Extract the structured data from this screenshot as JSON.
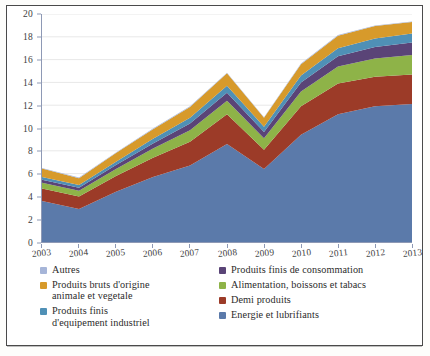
{
  "chart_data": {
    "type": "area",
    "stacked": true,
    "title": "",
    "subtitle": "",
    "xlabel": "",
    "ylabel": "",
    "grid": true,
    "grid_axis": "y",
    "legend_position": "bottom",
    "ylim": [
      0,
      20
    ],
    "yticks": [
      0,
      2,
      4,
      6,
      8,
      10,
      12,
      14,
      16,
      18,
      20
    ],
    "ytick_labels": [
      "0",
      "2",
      "4",
      "6",
      "8",
      "10",
      "12",
      "14",
      "16",
      "18",
      "20"
    ],
    "categories": [
      "2003",
      "2004",
      "2005",
      "2006",
      "2007",
      "2008",
      "2009",
      "2010",
      "2011",
      "2012",
      "2013"
    ],
    "x": [
      2003,
      2004,
      2005,
      2006,
      2007,
      2008,
      2009,
      2010,
      2011,
      2012,
      2013
    ],
    "series": [
      {
        "name": "Energie et lubrifiants",
        "color": "#5b7aaa",
        "values": [
          3.6,
          2.9,
          4.4,
          5.7,
          6.7,
          8.6,
          6.4,
          9.4,
          11.2,
          11.9,
          12.1
        ]
      },
      {
        "name": "Demi produits",
        "color": "#9c3b28",
        "values": [
          1.1,
          1.1,
          1.4,
          1.7,
          2.1,
          2.6,
          1.7,
          2.5,
          2.7,
          2.6,
          2.6
        ]
      },
      {
        "name": "Alimentation, boissons et tabacs",
        "color": "#8eb348",
        "values": [
          0.5,
          0.5,
          0.6,
          0.8,
          1.0,
          1.2,
          1.0,
          1.3,
          1.5,
          1.6,
          1.7
        ]
      },
      {
        "name": "Produits finis de consommation",
        "color": "#5a4477",
        "values": [
          0.25,
          0.25,
          0.35,
          0.45,
          0.6,
          0.7,
          0.55,
          0.8,
          0.9,
          1.0,
          1.1
        ]
      },
      {
        "name": "Produits finis d'equipement industriel",
        "color": "#4f90b6",
        "values": [
          0.25,
          0.25,
          0.3,
          0.4,
          0.5,
          0.6,
          0.45,
          0.6,
          0.7,
          0.75,
          0.8
        ]
      },
      {
        "name": "Produits bruts d'origine animale et vegetale",
        "color": "#d79a2b",
        "values": [
          0.75,
          0.6,
          0.75,
          0.85,
          0.95,
          1.1,
          0.8,
          1.0,
          1.1,
          1.1,
          1.0
        ]
      },
      {
        "name": "Autres",
        "color": "#a6b5d8",
        "values": [
          0.05,
          0.05,
          0.05,
          0.05,
          0.05,
          0.05,
          0.05,
          0.05,
          0.05,
          0.05,
          0.05
        ]
      }
    ],
    "totals": [
      6.5,
      5.65,
      7.85,
      9.95,
      11.9,
      14.85,
      10.95,
      15.65,
      18.15,
      19.0,
      19.35
    ]
  },
  "legend": {
    "left_column": [
      {
        "label": "Autres",
        "label_line2": "",
        "color": "#a6b5d8"
      },
      {
        "label": "Produits bruts d'origine",
        "label_line2": "animale et vegetale",
        "color": "#d79a2b"
      },
      {
        "label": "Produits finis",
        "label_line2": "d'equipement industriel",
        "color": "#4f90b6"
      }
    ],
    "right_column": [
      {
        "label": "Produits finis de consommation",
        "label_line2": "",
        "color": "#5a4477"
      },
      {
        "label": "Alimentation, boissons et tabacs",
        "label_line2": "",
        "color": "#8eb348"
      },
      {
        "label": "Demi produits",
        "label_line2": "",
        "color": "#9c3b28"
      },
      {
        "label": "Energie et lubrifiants",
        "label_line2": "",
        "color": "#5b7aaa"
      }
    ]
  },
  "colors": {
    "axis": "#8e99b5",
    "grid": "#e8e8e8",
    "border": "#4a4a4a",
    "text": "#2b2b2b",
    "background": "#ffffff"
  }
}
